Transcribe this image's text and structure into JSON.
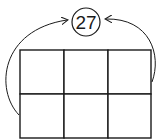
{
  "diagram": {
    "circle_value": "27",
    "grid": {
      "rows": 2,
      "cols": 3
    },
    "stroke_color": "#1a1a1a",
    "background_color": "#ffffff"
  }
}
